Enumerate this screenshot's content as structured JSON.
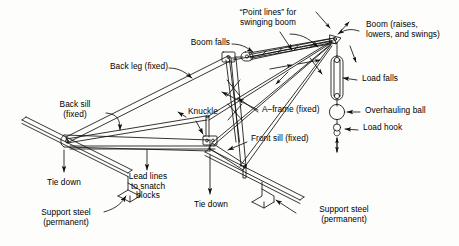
{
  "diagram": {
    "ink_color": "#111111",
    "background_color": "#fdfdfb"
  },
  "labels": {
    "point_lines": "“Point lines” for\nswinging boom",
    "boom_falls": "Boom falls",
    "boom": "Boom (raises,\nlowers, and swings)",
    "back_leg": "Back leg (fixed)",
    "back_sill": "Back sill\n(fixed)",
    "knuckle": "Knuckle",
    "a_frame": "A–frame (fixed)",
    "front_sill": "Front sill (fixed)",
    "load_falls": "Load falls",
    "overhauling_ball": "Overhauling ball",
    "load_hook": "Load hook",
    "lead_lines": "Lead lines\nto snatch\nblocks",
    "tie_down_left": "Tie down",
    "tie_down_mid": "Tie down",
    "support_steel_left": "Support steel\n(permanent)",
    "support_steel_right": "Support steel\n(permanent)"
  }
}
